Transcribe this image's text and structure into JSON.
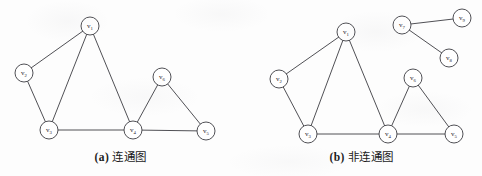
{
  "figure": {
    "background_color": "#fdfdfd",
    "ink_color": "#3c3c42",
    "node_fill": "#ffffff",
    "node_radius": 9
  },
  "panels": [
    {
      "id": "a",
      "caption_tag": "(a)",
      "caption_text": "连通图",
      "nodes": [
        {
          "id": "v1",
          "label": "v",
          "sub": "1",
          "x": 90,
          "y": 26
        },
        {
          "id": "v2",
          "label": "v",
          "sub": "2",
          "x": 24,
          "y": 73
        },
        {
          "id": "v3",
          "label": "v",
          "sub": "3",
          "x": 49,
          "y": 130
        },
        {
          "id": "v4",
          "label": "v",
          "sub": "4",
          "x": 133,
          "y": 130
        },
        {
          "id": "v5",
          "label": "v",
          "sub": "5",
          "x": 206,
          "y": 131
        },
        {
          "id": "v6",
          "label": "v",
          "sub": "6",
          "x": 162,
          "y": 77
        }
      ],
      "edges": [
        {
          "from": "v1",
          "to": "v2"
        },
        {
          "from": "v1",
          "to": "v3"
        },
        {
          "from": "v1",
          "to": "v4"
        },
        {
          "from": "v2",
          "to": "v3"
        },
        {
          "from": "v3",
          "to": "v4"
        },
        {
          "from": "v4",
          "to": "v6"
        },
        {
          "from": "v4",
          "to": "v5"
        },
        {
          "from": "v6",
          "to": "v5"
        }
      ]
    },
    {
      "id": "b",
      "caption_tag": "(b)",
      "caption_text": "非连通图",
      "nodes": [
        {
          "id": "v1",
          "label": "v",
          "sub": "1",
          "x": 105,
          "y": 32
        },
        {
          "id": "v2",
          "label": "v",
          "sub": "2",
          "x": 38,
          "y": 79
        },
        {
          "id": "v3",
          "label": "v",
          "sub": "3",
          "x": 67,
          "y": 134
        },
        {
          "id": "v4",
          "label": "v",
          "sub": "4",
          "x": 147,
          "y": 134
        },
        {
          "id": "v5",
          "label": "v",
          "sub": "5",
          "x": 213,
          "y": 134
        },
        {
          "id": "v6",
          "label": "v",
          "sub": "6",
          "x": 172,
          "y": 78
        },
        {
          "id": "v7",
          "label": "v",
          "sub": "7",
          "x": 161,
          "y": 25
        },
        {
          "id": "v8",
          "label": "v",
          "sub": "8",
          "x": 208,
          "y": 58
        },
        {
          "id": "v9",
          "label": "v",
          "sub": "9",
          "x": 221,
          "y": 18
        }
      ],
      "edges": [
        {
          "from": "v1",
          "to": "v2"
        },
        {
          "from": "v1",
          "to": "v3"
        },
        {
          "from": "v1",
          "to": "v4"
        },
        {
          "from": "v2",
          "to": "v3"
        },
        {
          "from": "v3",
          "to": "v4"
        },
        {
          "from": "v4",
          "to": "v6"
        },
        {
          "from": "v4",
          "to": "v5"
        },
        {
          "from": "v6",
          "to": "v5"
        },
        {
          "from": "v7",
          "to": "v9"
        },
        {
          "from": "v7",
          "to": "v8"
        }
      ]
    }
  ]
}
